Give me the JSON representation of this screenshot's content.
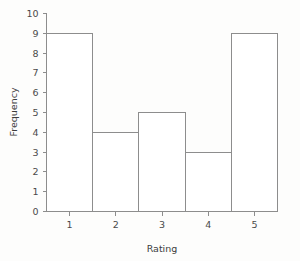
{
  "chart_data": {
    "type": "bar",
    "title": "",
    "subtitle": "",
    "xlabel": "Rating",
    "ylabel": "Frequency",
    "categories": [
      "1",
      "2",
      "3",
      "4",
      "5"
    ],
    "values": [
      9,
      4,
      5,
      3,
      9
    ],
    "series": [
      {
        "name": "Frequency",
        "values": [
          9,
          4,
          5,
          3,
          9
        ]
      }
    ],
    "xlim": [
      0.5,
      5.5
    ],
    "ylim": [
      0,
      10
    ],
    "x_tick_labels": [
      "1",
      "2",
      "3",
      "4",
      "5"
    ],
    "y_tick_labels": [
      "0",
      "1",
      "2",
      "3",
      "4",
      "5",
      "6",
      "7",
      "8",
      "9",
      "10"
    ],
    "y_ticks": [
      0,
      1,
      2,
      3,
      4,
      5,
      6,
      7,
      8,
      9,
      10
    ],
    "grid": false,
    "legend": false,
    "legend_position": "none",
    "bar_fill_color": "#ffffff",
    "bar_edge_color": "#8d8d8d",
    "axis_color": "#8d8d8d",
    "text_color": "#4a4a4a",
    "background_color": "#fdfdfc",
    "annotations": []
  },
  "axis": {
    "x_title": "Rating",
    "y_title": "Frequency"
  }
}
